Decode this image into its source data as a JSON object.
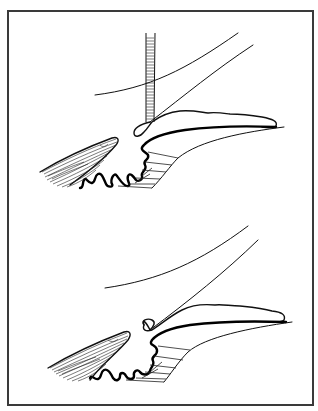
{
  "figure": {
    "type": "two-panel anatomical line illustration",
    "background_color": "#ffffff",
    "frame_color": "#3a3a3a",
    "ink_color": "#000000",
    "panels": [
      {
        "id": "top",
        "description": "Angle structures with vertical probe/instrument touching tissue"
      },
      {
        "id": "bottom",
        "description": "Same angle structures without instrument"
      }
    ]
  }
}
